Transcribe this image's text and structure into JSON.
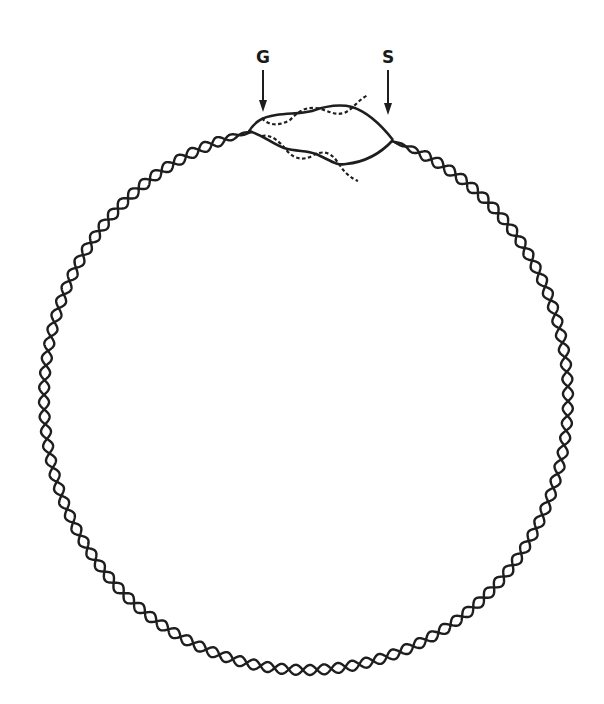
{
  "diagram": {
    "type": "circular-dna-replication",
    "stroke_color": "#1e1e1e",
    "background": "#ffffff",
    "circle": {
      "cx": 306,
      "cy": 398,
      "rx": 262,
      "ry": 272,
      "helix_turns": 58,
      "amplitude": 5
    },
    "labels": [
      {
        "id": "G",
        "text": "G",
        "x": 263,
        "y": 57,
        "arrow": {
          "x": 263,
          "y1": 70,
          "y2": 112
        }
      },
      {
        "id": "S",
        "text": "S",
        "x": 388,
        "y": 57,
        "arrow": {
          "x": 388,
          "y1": 70,
          "y2": 115
        }
      }
    ],
    "bubble": {
      "left_fork": [
        252,
        130
      ],
      "right_fork": [
        393,
        140
      ],
      "strands": [
        {
          "name": "upper-parental",
          "style": "solid"
        },
        {
          "name": "upper-new",
          "style": "dashed"
        },
        {
          "name": "lower-parental",
          "style": "solid"
        },
        {
          "name": "lower-new",
          "style": "dashed"
        }
      ]
    }
  }
}
